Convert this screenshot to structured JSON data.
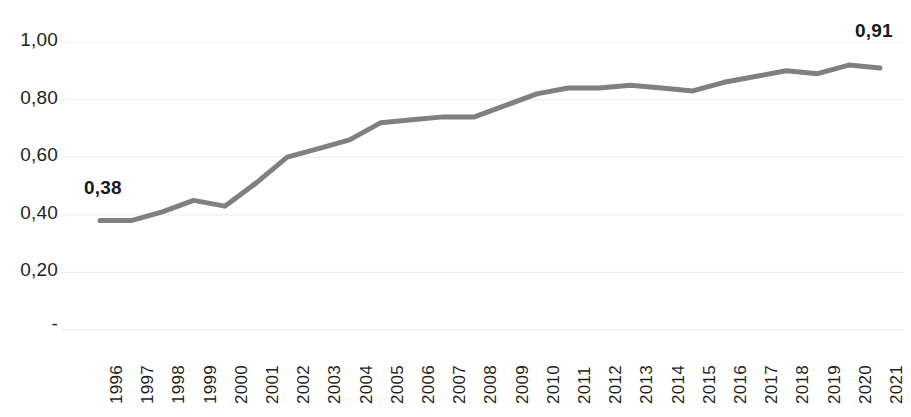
{
  "chart_data": {
    "type": "line",
    "title": "",
    "subtitle": "",
    "xlabel": "",
    "ylabel": "",
    "grid": true,
    "legend_position": "none",
    "line_color": "#808080",
    "text_color": "#231f20",
    "gridline_color": "#efefef",
    "ylim": [
      0,
      1.05
    ],
    "ytick_values": [
      0,
      0.2,
      0.4,
      0.6,
      0.8,
      1.0
    ],
    "ytick_labels": [
      "-",
      "0,20",
      "0,40",
      "0,60",
      "0,80",
      "1,00"
    ],
    "categories": [
      "1996",
      "1997",
      "1998",
      "1999",
      "2000",
      "2001",
      "2002",
      "2003",
      "2004",
      "2005",
      "2006",
      "2007",
      "2008",
      "2009",
      "2010",
      "2011",
      "2012",
      "2013",
      "2014",
      "2015",
      "2016",
      "2017",
      "2018",
      "2019",
      "2020",
      "2021"
    ],
    "values": [
      0.38,
      0.38,
      0.41,
      0.45,
      0.43,
      0.51,
      0.6,
      0.63,
      0.66,
      0.72,
      0.73,
      0.74,
      0.74,
      0.78,
      0.82,
      0.84,
      0.84,
      0.85,
      0.84,
      0.83,
      0.86,
      0.88,
      0.9,
      0.89,
      0.92,
      0.91
    ],
    "annotations": [
      {
        "name": "first-value-label",
        "text": "0,38",
        "category": "1996",
        "value": 0.38
      },
      {
        "name": "last-value-label",
        "text": "0,91",
        "category": "2021",
        "value": 0.91
      }
    ]
  }
}
